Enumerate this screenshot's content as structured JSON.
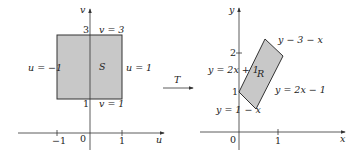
{
  "left_plot": {
    "axis_x_label": "u",
    "axis_y_label": "v",
    "region_label": "S",
    "ticks_x": [
      "−1",
      "0",
      "1"
    ],
    "ticks_y": [
      "1",
      "3"
    ],
    "boundaries": {
      "left": "u = −1",
      "right": "u = 1",
      "top": "v = 3",
      "bottom": "v = 1"
    },
    "fill_color": "#c8c8c8"
  },
  "transform": {
    "label": "T"
  },
  "right_plot": {
    "axis_x_label": "x",
    "axis_y_label": "y",
    "region_label": "R",
    "ticks_x": [
      "0",
      "1"
    ],
    "ticks_y": [
      "1",
      "2"
    ],
    "boundaries": {
      "upper_left": "y = 2x + 1",
      "upper_right": "y − 3 − x",
      "lower_right": "y = 2x − 1",
      "lower_left": "y = 1 − x"
    },
    "vertices": [
      [
        0,
        1
      ],
      [
        0.6667,
        0.3333
      ],
      [
        1.3333,
        1.6667
      ],
      [
        0.6667,
        2.3333
      ]
    ],
    "fill_color": "#c8c8c8"
  }
}
